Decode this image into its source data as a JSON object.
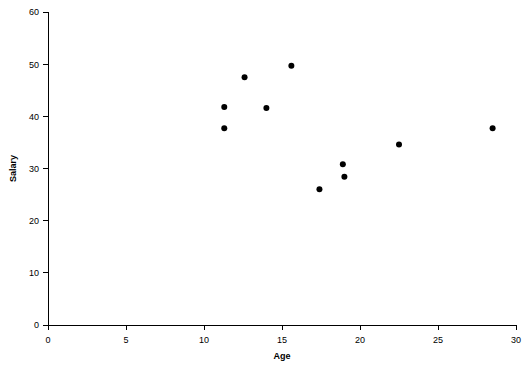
{
  "chart_data": {
    "type": "scatter",
    "title": "",
    "xlabel": "Age",
    "ylabel": "Salary",
    "xlim": [
      0,
      30
    ],
    "ylim": [
      0,
      60
    ],
    "xticks": [
      0,
      5,
      10,
      15,
      20,
      25,
      30
    ],
    "yticks": [
      0,
      10,
      20,
      30,
      40,
      50,
      60
    ],
    "xtick_labels": [
      "0",
      "5",
      "10",
      "15",
      "20",
      "25",
      "30"
    ],
    "ytick_labels": [
      "0",
      "10",
      "20",
      "30",
      "40",
      "50",
      "60"
    ],
    "grid": false,
    "legend": null,
    "marker": "filled-circle",
    "marker_color": "#000000",
    "marker_size": 3,
    "series": [
      {
        "name": "observations",
        "points": [
          {
            "x": 11.3,
            "y": 41.8
          },
          {
            "x": 11.3,
            "y": 37.7
          },
          {
            "x": 12.6,
            "y": 47.5
          },
          {
            "x": 14.0,
            "y": 41.6
          },
          {
            "x": 15.6,
            "y": 49.7
          },
          {
            "x": 17.4,
            "y": 26.0
          },
          {
            "x": 18.9,
            "y": 30.8
          },
          {
            "x": 19.0,
            "y": 28.4
          },
          {
            "x": 22.5,
            "y": 34.6
          },
          {
            "x": 28.5,
            "y": 37.7
          }
        ]
      }
    ]
  },
  "colors": {
    "axis": "#000000",
    "marker": "#000000",
    "background": "#ffffff"
  }
}
